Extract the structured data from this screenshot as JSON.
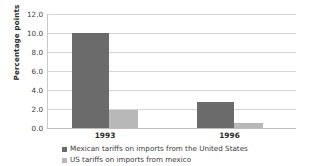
{
  "chart_data": {
    "type": "bar",
    "title": "",
    "xlabel": "",
    "ylabel": "Percentage points",
    "categories": [
      "1993",
      "1996"
    ],
    "series": [
      {
        "name": "Mexican tariffs on imports from the United States",
        "color": "#6b6b6b",
        "values": [
          10.0,
          2.7
        ]
      },
      {
        "name": "US tariffs on imports from mexico",
        "color": "#b8b8b8",
        "values": [
          1.9,
          0.5
        ]
      }
    ],
    "ylim": [
      0.0,
      12.0
    ],
    "ytick_step": 2.0,
    "ytick_labels": [
      "0.0",
      "2.0",
      "4.0",
      "6.0",
      "8.0",
      "10.0",
      "12.0"
    ],
    "grid": true,
    "legend_position": "bottom-left"
  },
  "axes": {
    "y_title": "Percentage points"
  }
}
